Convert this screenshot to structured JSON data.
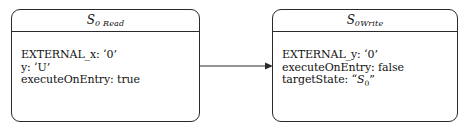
{
  "diagram": {
    "type": "state-transition",
    "background_color": "#ffffff",
    "stroke_color": "#2a2a2a",
    "text_color": "#111111",
    "nodes": [
      {
        "id": "s0read",
        "title_main": "S",
        "title_sub": "0 Read",
        "title_full": "S0 Read",
        "attributes": [
          {
            "key": "EXTERNAL_x",
            "value": "‘0’",
            "text": "EXTERNAL_x: ‘0’"
          },
          {
            "key": "y",
            "value": "‘U’",
            "text": "y: ‘U’"
          },
          {
            "key": "executeOnEntry",
            "value": "true",
            "text": "executeOnEntry: true"
          }
        ]
      },
      {
        "id": "s0write",
        "title_main": "S",
        "title_sub": "0Write",
        "title_full": "S0Write",
        "attributes": [
          {
            "key": "EXTERNAL_y",
            "value": "‘0’",
            "text": "EXTERNAL_y: ‘0’"
          },
          {
            "key": "executeOnEntry",
            "value": "false",
            "text": "executeOnEntry: false"
          },
          {
            "key": "targetState",
            "value": "“S0”",
            "text_prefix": "targetState: “",
            "state_main": "S",
            "state_sub": "0",
            "text_suffix": "”"
          }
        ]
      }
    ],
    "edges": [
      {
        "id": "read-to-write",
        "from": "s0read",
        "to": "s0write",
        "label": "",
        "direction": "right",
        "style": "solid-arrow"
      }
    ]
  }
}
